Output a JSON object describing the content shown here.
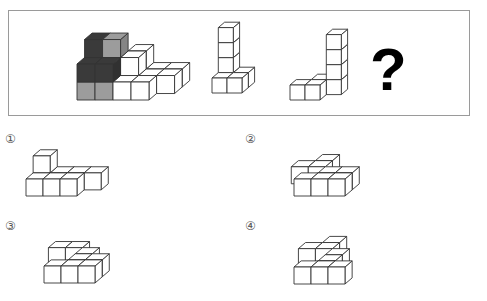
{
  "puzzle": {
    "question_mark": "?",
    "colors": {
      "dark": "#3a3a3a",
      "gray": "#9c9c9c",
      "white": "#ffffff",
      "border": "#9a9a9a"
    },
    "figures": [
      {
        "name": "combined-shape",
        "note": "assembled shape with dark and gray highlighted pieces"
      },
      {
        "name": "piece-a"
      },
      {
        "name": "piece-b"
      }
    ]
  },
  "options": [
    {
      "label": "①"
    },
    {
      "label": "②"
    },
    {
      "label": "③"
    },
    {
      "label": "④"
    }
  ]
}
